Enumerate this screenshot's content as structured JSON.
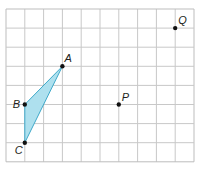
{
  "diagram": {
    "grid": {
      "columns": 10,
      "rows": 8,
      "left": 6,
      "top": 9,
      "cell_w": 18.8,
      "cell_h": 19.1,
      "line_color": "#c8c8c8",
      "border_color": "#bdbdbd"
    },
    "triangle": {
      "vertices": [
        "A",
        "B",
        "C"
      ],
      "fill": "#aee0ee",
      "stroke": "#3fa9c9"
    },
    "points": [
      {
        "name": "A",
        "label": "A",
        "gx": 3,
        "gy": 3
      },
      {
        "name": "B",
        "label": "B",
        "gx": 1,
        "gy": 5
      },
      {
        "name": "C",
        "label": "C",
        "gx": 1,
        "gy": 7
      },
      {
        "name": "P",
        "label": "P",
        "gx": 6,
        "gy": 5
      },
      {
        "name": "Q",
        "label": "Q",
        "gx": 9,
        "gy": 1
      }
    ],
    "point_color": "#111111"
  }
}
